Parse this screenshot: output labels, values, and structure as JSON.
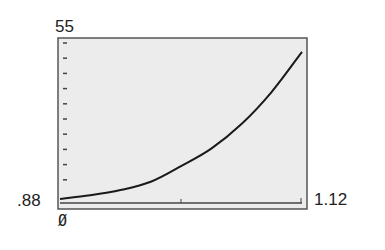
{
  "chart_data": {
    "type": "line",
    "title": "",
    "xlabel": "",
    "ylabel": "",
    "xlim": [
      0.88,
      1.12
    ],
    "ylim": [
      0,
      55
    ],
    "x_tick_labels": [
      ".88",
      "1.12"
    ],
    "y_tick_labels": [
      "Ø",
      "55"
    ],
    "y_tick_count": 10,
    "x_tick_marks": [
      1.0,
      1.12
    ],
    "grid": false,
    "legend": null,
    "series": [
      {
        "name": "curve",
        "x": [
          0.88,
          0.91,
          0.94,
          0.97,
          1.0,
          1.03,
          1.06,
          1.09,
          1.12
        ],
        "y": [
          2.6,
          3.8,
          5.5,
          8.2,
          13.3,
          19.0,
          27.0,
          37.5,
          50.5
        ]
      }
    ],
    "colors": {
      "plot_background": "#ececec",
      "frame": "#555555",
      "line": "#1a1a1a"
    }
  },
  "labels": {
    "ymax": "55",
    "xmin": ".88",
    "xmax": "1.12",
    "origin": "Ø"
  }
}
